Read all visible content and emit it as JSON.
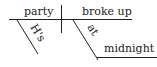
{
  "diagram": {
    "type": "sentence-diagram",
    "subject": "party",
    "predicate": "broke up",
    "subject_modifier": "H's",
    "predicate_modifier": {
      "preposition": "at",
      "object": "midnight"
    }
  }
}
